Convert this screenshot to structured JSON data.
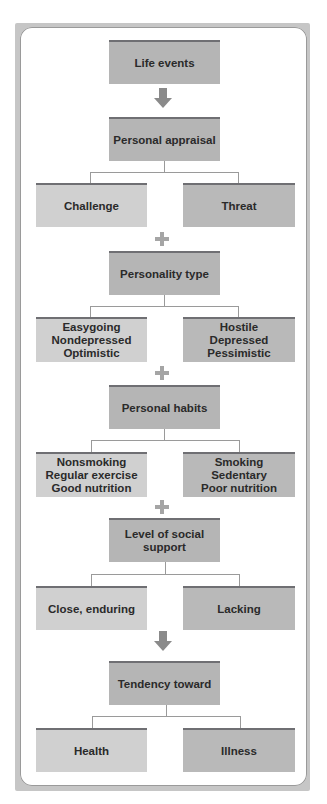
{
  "diagram": {
    "type": "flowchart",
    "colors": {
      "frame": "#c6c6c6",
      "center_box": "#b5b5b5",
      "left_box": "#d0d0d0",
      "right_box": "#b9b9b9",
      "box_top_border": "#6f6f73",
      "connector": "#a5a5a5"
    },
    "nodes": {
      "life_events": "Life events",
      "personal_appraisal": "Personal appraisal",
      "challenge": "Challenge",
      "threat": "Threat",
      "personality_type": "Personality type",
      "easygoing": "Easygoing\nNondepressed\nOptimistic",
      "hostile": "Hostile\nDepressed\nPessimistic",
      "personal_habits": "Personal habits",
      "nonsmoking": "Nonsmoking\nRegular exercise\nGood nutrition",
      "smoking": "Smoking\nSedentary\nPoor nutrition",
      "social_support": "Level of social support",
      "close_enduring": "Close, enduring",
      "lacking": "Lacking",
      "tendency_toward": "Tendency toward",
      "health": "Health",
      "illness": "Illness"
    },
    "connectors": [
      {
        "from": "life_events",
        "to": "personal_appraisal",
        "symbol": "arrow-down"
      },
      {
        "from": "personal_appraisal",
        "to": [
          "challenge",
          "threat"
        ],
        "symbol": "branch"
      },
      {
        "from": "challenge/threat",
        "to": "personality_type",
        "symbol": "plus"
      },
      {
        "from": "personality_type",
        "to": [
          "easygoing",
          "hostile"
        ],
        "symbol": "branch"
      },
      {
        "from": "easygoing/hostile",
        "to": "personal_habits",
        "symbol": "plus"
      },
      {
        "from": "personal_habits",
        "to": [
          "nonsmoking",
          "smoking"
        ],
        "symbol": "branch"
      },
      {
        "from": "nonsmoking/smoking",
        "to": "social_support",
        "symbol": "plus"
      },
      {
        "from": "social_support",
        "to": [
          "close_enduring",
          "lacking"
        ],
        "symbol": "branch"
      },
      {
        "from": "close_enduring/lacking",
        "to": "tendency_toward",
        "symbol": "arrow-down"
      },
      {
        "from": "tendency_toward",
        "to": [
          "health",
          "illness"
        ],
        "symbol": "branch"
      }
    ]
  }
}
